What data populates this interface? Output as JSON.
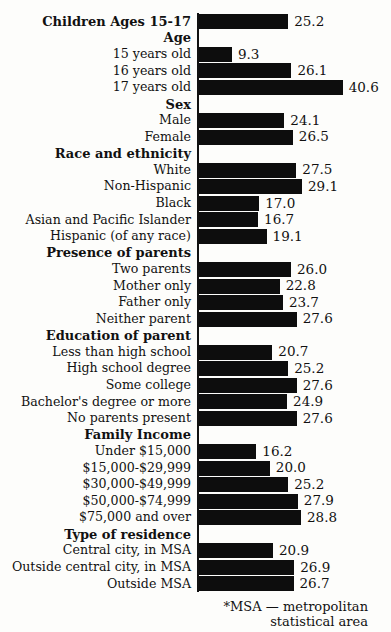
{
  "chart_data": {
    "type": "bar",
    "orientation": "horizontal",
    "unit": "percent",
    "xlim": [
      0,
      45
    ],
    "px_per_unit": 3.54,
    "bar_color": "#0d0d0d",
    "background_color": "#fdfdfb",
    "grid": false,
    "legend": false,
    "rows": [
      {
        "label": "Children Ages 15-17",
        "value": 25.2,
        "bold": true
      },
      {
        "label": "Age",
        "value": null,
        "bold": true
      },
      {
        "label": "15 years old",
        "value": 9.3,
        "bold": false
      },
      {
        "label": "16 years old",
        "value": 26.1,
        "bold": false
      },
      {
        "label": "17 years old",
        "value": 40.6,
        "bold": false
      },
      {
        "label": "Sex",
        "value": null,
        "bold": true
      },
      {
        "label": "Male",
        "value": 24.1,
        "bold": false
      },
      {
        "label": "Female",
        "value": 26.5,
        "bold": false
      },
      {
        "label": "Race and ethnicity",
        "value": null,
        "bold": true
      },
      {
        "label": "White",
        "value": 27.5,
        "bold": false
      },
      {
        "label": "Non-Hispanic",
        "value": 29.1,
        "bold": false
      },
      {
        "label": "Black",
        "value": 17.0,
        "bold": false
      },
      {
        "label": "Asian and Pacific Islander",
        "value": 16.7,
        "bold": false
      },
      {
        "label": "Hispanic (of any race)",
        "value": 19.1,
        "bold": false
      },
      {
        "label": "Presence of parents",
        "value": null,
        "bold": true
      },
      {
        "label": "Two parents",
        "value": 26.0,
        "bold": false
      },
      {
        "label": "Mother only",
        "value": 22.8,
        "bold": false
      },
      {
        "label": "Father only",
        "value": 23.7,
        "bold": false
      },
      {
        "label": "Neither parent",
        "value": 27.6,
        "bold": false
      },
      {
        "label": "Education of parent",
        "value": null,
        "bold": true
      },
      {
        "label": "Less than high school",
        "value": 20.7,
        "bold": false
      },
      {
        "label": "High school degree",
        "value": 25.2,
        "bold": false
      },
      {
        "label": "Some college",
        "value": 27.6,
        "bold": false
      },
      {
        "label": "Bachelor's degree or more",
        "value": 24.9,
        "bold": false
      },
      {
        "label": "No parents present",
        "value": 27.6,
        "bold": false
      },
      {
        "label": "Family Income",
        "value": null,
        "bold": true
      },
      {
        "label": "Under $15,000",
        "value": 16.2,
        "bold": false
      },
      {
        "label": "$15,000-$29,999",
        "value": 20.0,
        "bold": false
      },
      {
        "label": "$30,000-$49,999",
        "value": 25.2,
        "bold": false
      },
      {
        "label": "$50,000-$74,999",
        "value": 27.9,
        "bold": false
      },
      {
        "label": "$75,000 and over",
        "value": 28.8,
        "bold": false
      },
      {
        "label": "Type of residence",
        "value": null,
        "bold": true
      },
      {
        "label": "Central city, in MSA",
        "value": 20.9,
        "bold": false
      },
      {
        "label": "Outside central city, in MSA",
        "value": 26.9,
        "bold": false
      },
      {
        "label": "Outside MSA",
        "value": 26.7,
        "bold": false
      }
    ]
  },
  "footnote": {
    "line1": "*MSA — metropolitan",
    "line2": "statistical area"
  }
}
